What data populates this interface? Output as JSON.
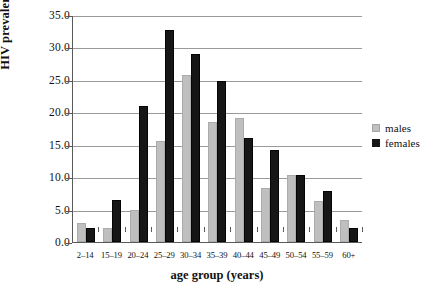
{
  "chart_data": {
    "type": "bar",
    "title": "",
    "xlabel": "age group (years)",
    "ylabel": "HIV prevalence (%)",
    "categories": [
      "2–14",
      "15–19",
      "20–24",
      "25–29",
      "30–34",
      "35–39",
      "40–44",
      "45–49",
      "50–54",
      "55–59",
      "60+"
    ],
    "series": [
      {
        "name": "males",
        "color": "#bfbfbf",
        "values": [
          2.9,
          2.2,
          4.9,
          15.5,
          25.7,
          18.5,
          19.1,
          8.4,
          10.4,
          6.4,
          3.4
        ]
      },
      {
        "name": "females",
        "color": "#161616",
        "values": [
          2.2,
          6.5,
          21.0,
          32.7,
          29.0,
          24.9,
          16.0,
          14.2,
          10.3,
          7.9,
          2.2
        ]
      }
    ],
    "ylim": [
      0,
      35
    ],
    "ytick_step": 5,
    "ytick_labels": [
      "0.0",
      "5.0",
      "10.0",
      "15.0",
      "20.0",
      "25.0",
      "30.0",
      "35.0"
    ],
    "grid": true,
    "legend_position": "right",
    "legend_entries": [
      "males",
      "females"
    ]
  }
}
